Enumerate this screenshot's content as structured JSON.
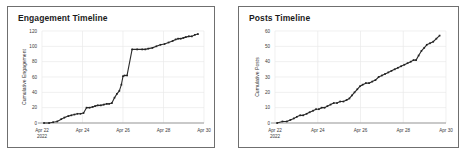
{
  "page": {
    "background": "#ffffff",
    "panel_border_color": "#6f6f6f",
    "series_color": "#2b2b2b",
    "grid_color": "#e9e9e9"
  },
  "panels": [
    {
      "id": "engagement",
      "title": "Engagement Timeline"
    },
    {
      "id": "posts",
      "title": "Posts Timeline"
    }
  ],
  "chart_data": [
    {
      "type": "line",
      "title": "Engagement Timeline",
      "xlabel": "",
      "ylabel": "Cumulative Engagement",
      "ylim": [
        0,
        120
      ],
      "yticks": [
        0,
        20,
        40,
        60,
        80,
        100,
        120
      ],
      "ytick_labels": [
        "0",
        "20",
        "40",
        "60",
        "80",
        "100",
        "120"
      ],
      "xlim": [
        0,
        8
      ],
      "xticks": [
        0,
        2,
        4,
        6,
        8
      ],
      "xtick_labels": [
        "Apr 22",
        "Apr 24",
        "Apr 26",
        "Apr 28",
        "Apr 30"
      ],
      "xtick_sublabels": [
        "2022",
        "",
        "",
        "",
        ""
      ],
      "grid": true,
      "legend": false,
      "markers": true,
      "series": [
        {
          "name": "Cumulative Engagement",
          "x": [
            0.1,
            0.35,
            0.55,
            0.75,
            0.95,
            1.1,
            1.3,
            1.45,
            1.6,
            1.75,
            1.9,
            2.05,
            2.2,
            2.35,
            2.5,
            2.62,
            2.75,
            2.9,
            3.05,
            3.2,
            3.32,
            3.45,
            3.58,
            3.7,
            3.82,
            3.92,
            4.0,
            4.08,
            4.2,
            4.45,
            4.7,
            4.95,
            5.1,
            5.25,
            5.45,
            5.65,
            5.85,
            6.05,
            6.25,
            6.45,
            6.6,
            6.72,
            6.85,
            6.98,
            7.1,
            7.25,
            7.4,
            7.55,
            7.7
          ],
          "y": [
            0,
            0,
            1,
            2,
            5,
            7,
            9,
            10,
            11,
            12,
            12,
            13,
            20,
            20,
            21,
            22,
            23,
            23,
            24,
            25,
            25,
            26,
            33,
            38,
            42,
            50,
            61,
            62,
            62,
            96,
            96,
            96,
            96,
            97,
            98,
            100,
            102,
            103,
            105,
            107,
            109,
            110,
            110,
            111,
            112,
            113,
            113,
            115,
            116
          ]
        }
      ]
    },
    {
      "type": "line",
      "title": "Posts Timeline",
      "xlabel": "",
      "ylabel": "Cumulative Posts",
      "ylim": [
        0,
        60
      ],
      "yticks": [
        0,
        10,
        20,
        30,
        40,
        50,
        60
      ],
      "ytick_labels": [
        "0",
        "10",
        "20",
        "30",
        "40",
        "50",
        "60"
      ],
      "xlim": [
        0,
        8
      ],
      "xticks": [
        0,
        2,
        4,
        6,
        8
      ],
      "xtick_labels": [
        "Apr 22",
        "Apr 24",
        "Apr 26",
        "Apr 28",
        "Apr 30"
      ],
      "xtick_sublabels": [
        "2022",
        "",
        "",
        "",
        ""
      ],
      "grid": true,
      "legend": false,
      "markers": true,
      "series": [
        {
          "name": "Cumulative Posts",
          "x": [
            0.1,
            0.35,
            0.55,
            0.72,
            0.88,
            1.02,
            1.18,
            1.32,
            1.48,
            1.62,
            1.78,
            1.92,
            2.05,
            2.18,
            2.32,
            2.45,
            2.6,
            2.75,
            2.9,
            3.05,
            3.2,
            3.35,
            3.48,
            3.6,
            3.72,
            3.85,
            3.98,
            4.1,
            4.25,
            4.4,
            4.55,
            4.7,
            4.85,
            5.0,
            5.15,
            5.3,
            5.45,
            5.6,
            5.75,
            5.9,
            6.05,
            6.2,
            6.35,
            6.48,
            6.6,
            6.72,
            6.85,
            6.98,
            7.1,
            7.25,
            7.4,
            7.55,
            7.7
          ],
          "y": [
            0,
            1,
            1,
            2,
            3,
            4,
            5,
            5,
            6,
            7,
            8,
            9,
            9,
            10,
            10,
            11,
            12,
            13,
            13,
            14,
            14,
            15,
            16,
            18,
            20,
            22,
            24,
            25,
            26,
            26,
            27,
            28,
            30,
            31,
            32,
            33,
            34,
            35,
            36,
            37,
            38,
            39,
            40,
            41,
            41,
            44,
            47,
            49,
            51,
            52,
            53,
            55,
            57
          ]
        }
      ]
    }
  ]
}
